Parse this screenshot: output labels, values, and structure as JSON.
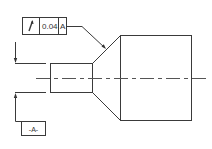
{
  "drawing": {
    "type": "gdt-runout-callout",
    "feature_control_frame": {
      "symbol": "circular-runout",
      "symbol_glyph": "↗",
      "tolerance": "0.04",
      "datum_reference": "A"
    },
    "datum_feature": {
      "label": "-A-"
    },
    "colors": {
      "line": "#3a3a3a",
      "background": "#ffffff"
    }
  }
}
